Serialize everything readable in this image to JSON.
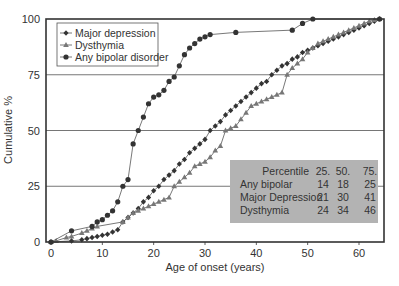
{
  "chart_data": {
    "type": "line",
    "title": "",
    "xlabel": "Age of onset (years)",
    "ylabel": "Cumulative %",
    "xlim": [
      0,
      65
    ],
    "ylim": [
      0,
      100
    ],
    "x_ticks": [
      0,
      10,
      20,
      30,
      40,
      50,
      60
    ],
    "y_ticks": [
      0,
      25,
      50,
      75,
      100
    ],
    "grid": "horizontal",
    "legend_position": "upper-left",
    "series": [
      {
        "name": "Major depression",
        "marker": "diamond",
        "color": "#333333",
        "points": [
          [
            0,
            0
          ],
          [
            4,
            0.5
          ],
          [
            6,
            1
          ],
          [
            7,
            1.5
          ],
          [
            8,
            2
          ],
          [
            9,
            2.5
          ],
          [
            10,
            3
          ],
          [
            11,
            3.5
          ],
          [
            12,
            4.5
          ],
          [
            13,
            5.5
          ],
          [
            14,
            9
          ],
          [
            15,
            11
          ],
          [
            16,
            13
          ],
          [
            17,
            15
          ],
          [
            18,
            18
          ],
          [
            19,
            20
          ],
          [
            20,
            23
          ],
          [
            21,
            25
          ],
          [
            22,
            28
          ],
          [
            23,
            30
          ],
          [
            24,
            32
          ],
          [
            25,
            35
          ],
          [
            26,
            37
          ],
          [
            27,
            40
          ],
          [
            28,
            42
          ],
          [
            29,
            44
          ],
          [
            30,
            46
          ],
          [
            31,
            50
          ],
          [
            32,
            52
          ],
          [
            33,
            54
          ],
          [
            34,
            57
          ],
          [
            35,
            59
          ],
          [
            36,
            61
          ],
          [
            37,
            63
          ],
          [
            38,
            65
          ],
          [
            39,
            67
          ],
          [
            40,
            69
          ],
          [
            41,
            71
          ],
          [
            42,
            72
          ],
          [
            43,
            75
          ],
          [
            44,
            77
          ],
          [
            45,
            79
          ],
          [
            46,
            80
          ],
          [
            47,
            82
          ],
          [
            48,
            83
          ],
          [
            49,
            85
          ],
          [
            50,
            86
          ],
          [
            51,
            87
          ],
          [
            52,
            88
          ],
          [
            53,
            89
          ],
          [
            54,
            90
          ],
          [
            55,
            91
          ],
          [
            56,
            92
          ],
          [
            57,
            93
          ],
          [
            58,
            94
          ],
          [
            59,
            95
          ],
          [
            60,
            96
          ],
          [
            61,
            97
          ],
          [
            62,
            98
          ],
          [
            63,
            99
          ],
          [
            64,
            100
          ]
        ]
      },
      {
        "name": "Dysthymia",
        "marker": "triangle",
        "color": "#777777",
        "points": [
          [
            0,
            0
          ],
          [
            1,
            0.5
          ],
          [
            3,
            2
          ],
          [
            4,
            2.5
          ],
          [
            6,
            4
          ],
          [
            7,
            5
          ],
          [
            8,
            6
          ],
          [
            9,
            7
          ],
          [
            14,
            9
          ],
          [
            15,
            11
          ],
          [
            16,
            13
          ],
          [
            17,
            14
          ],
          [
            18,
            15
          ],
          [
            19,
            16
          ],
          [
            20,
            17
          ],
          [
            21,
            18
          ],
          [
            22,
            19
          ],
          [
            23,
            20
          ],
          [
            24,
            25
          ],
          [
            25,
            27
          ],
          [
            26,
            29
          ],
          [
            27,
            31
          ],
          [
            28,
            34
          ],
          [
            29,
            35
          ],
          [
            30,
            36
          ],
          [
            31,
            38
          ],
          [
            32,
            41
          ],
          [
            33,
            43
          ],
          [
            34,
            50
          ],
          [
            35,
            51
          ],
          [
            36,
            52
          ],
          [
            37,
            55
          ],
          [
            38,
            58
          ],
          [
            39,
            61
          ],
          [
            40,
            62
          ],
          [
            41,
            63
          ],
          [
            42,
            64
          ],
          [
            43,
            65
          ],
          [
            44,
            66
          ],
          [
            45,
            67
          ],
          [
            46,
            75
          ],
          [
            47,
            78
          ],
          [
            48,
            80
          ],
          [
            49,
            82
          ],
          [
            50,
            85
          ],
          [
            51,
            87
          ],
          [
            52,
            89
          ],
          [
            53,
            90
          ],
          [
            54,
            91
          ],
          [
            55,
            92
          ],
          [
            56,
            93
          ],
          [
            57,
            94
          ],
          [
            58,
            95
          ],
          [
            59,
            96
          ],
          [
            60,
            97
          ],
          [
            61,
            98
          ],
          [
            62,
            99
          ],
          [
            63,
            99.5
          ],
          [
            64,
            100
          ]
        ]
      },
      {
        "name": "Any bipolar disorder",
        "marker": "circle",
        "color": "#333333",
        "points": [
          [
            0,
            0
          ],
          [
            4,
            5
          ],
          [
            8,
            7
          ],
          [
            9,
            9
          ],
          [
            10,
            10
          ],
          [
            11,
            12
          ],
          [
            12,
            14
          ],
          [
            13,
            18
          ],
          [
            14,
            25
          ],
          [
            15,
            28
          ],
          [
            16,
            44
          ],
          [
            17,
            50
          ],
          [
            18,
            56
          ],
          [
            19,
            62
          ],
          [
            20,
            65
          ],
          [
            21,
            66
          ],
          [
            22,
            68
          ],
          [
            23,
            72
          ],
          [
            24,
            74
          ],
          [
            25,
            79
          ],
          [
            26,
            84
          ],
          [
            27,
            87
          ],
          [
            28,
            89
          ],
          [
            29,
            91
          ],
          [
            30,
            92
          ],
          [
            31,
            93
          ],
          [
            36,
            94
          ],
          [
            47,
            95
          ],
          [
            49,
            98
          ],
          [
            51,
            100
          ],
          [
            64,
            100
          ]
        ]
      }
    ],
    "percentile_table": {
      "columns": [
        "Percentile",
        "25.",
        "50.",
        "75."
      ],
      "rows": [
        [
          "Any bipolar",
          "14",
          "18",
          "25"
        ],
        [
          "Major Depression",
          "21",
          "30",
          "41"
        ],
        [
          "Dysthymia",
          "24",
          "34",
          "46"
        ]
      ]
    }
  },
  "legend": [
    {
      "label": "Major depression",
      "marker": "diamond"
    },
    {
      "label": "Dysthymia",
      "marker": "triangle"
    },
    {
      "label": "Any bipolar disorder",
      "marker": "circle"
    }
  ],
  "table_colors": {
    "background": "#b3b3b3",
    "text": "#222222"
  }
}
